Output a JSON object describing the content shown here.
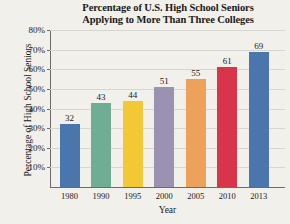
{
  "chart_data": {
    "type": "bar",
    "title": "Percentage of U.S. High School Seniors Applying to More Than Three Colleges",
    "title_lines": [
      "Percentage of U.S. High School Seniors",
      "Applying to More Than Three Colleges"
    ],
    "xlabel": "Year",
    "ylabel": "Percentage of High School Seniors",
    "categories": [
      "1980",
      "1990",
      "1995",
      "2000",
      "2005",
      "2010",
      "2013"
    ],
    "values": [
      32,
      43,
      44,
      51,
      55,
      61,
      69
    ],
    "value_labels": [
      "32",
      "43",
      "44",
      "51",
      "55",
      "61",
      "69"
    ],
    "bar_colors": [
      "#4a76ad",
      "#6fae95",
      "#f2c835",
      "#9b91b0",
      "#eda15a",
      "#d8354c",
      "#4a76ad"
    ],
    "ylim": [
      0,
      80
    ],
    "ytick_labels": [
      "10%",
      "20%",
      "30%",
      "40%",
      "50%",
      "60%",
      "70%",
      "80%"
    ],
    "ytick_values": [
      10,
      20,
      30,
      40,
      50,
      60,
      70,
      80
    ],
    "grid": true,
    "legend": false,
    "background_color": "#f2f0ea",
    "axis_color": "#6b6b6b",
    "gridline_color": "#d7d5cf"
  }
}
